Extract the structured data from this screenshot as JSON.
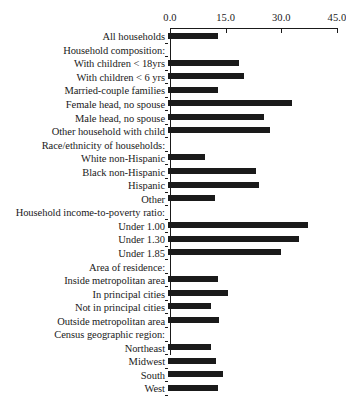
{
  "chart_data": {
    "type": "bar",
    "orientation": "horizontal",
    "title": "",
    "xlabel": "",
    "ylabel": "",
    "xlim": [
      0.0,
      45.0
    ],
    "xticks": [
      "0.0",
      "15.0",
      "30.0",
      "45.0"
    ],
    "xtick_values": [
      0.0,
      15.0,
      30.0,
      45.0
    ],
    "grid": false,
    "legend": false,
    "bar_color": "#1a1a1a",
    "categories": [
      "All households",
      "Household composition:",
      "With children < 18yrs",
      "With children < 6 yrs",
      "Married-couple families",
      "Female head, no spouse",
      "Male head, no spouse",
      "Other household with child",
      "Race/ethnicity of households:",
      "White non-Hispanic",
      "Black non-Hispanic",
      "Hispanic",
      "Other",
      "Household income-to-poverty ratio:",
      "Under 1.00",
      "Under 1.30",
      "Under 1.85",
      "Area of residence:",
      "Inside metropolitan area",
      "In principal cities",
      "Not in principal cities",
      "Outside metropolitan area",
      "Census geographic region:",
      "Northeast",
      "Midwest",
      "South",
      "West"
    ],
    "values": [
      13.5,
      null,
      19.1,
      20.5,
      13.5,
      33.4,
      25.9,
      27.5,
      null,
      10.0,
      23.7,
      24.5,
      12.7,
      null,
      37.7,
      35.3,
      30.5,
      null,
      13.5,
      16.2,
      11.6,
      13.7,
      null,
      11.6,
      12.9,
      14.8,
      13.5
    ],
    "rows": [
      {
        "label": "All households",
        "value": 13.5,
        "is_header": false
      },
      {
        "label": "Household composition:",
        "value": null,
        "is_header": true
      },
      {
        "label": "With children < 18yrs",
        "value": 19.1,
        "is_header": false
      },
      {
        "label": "With children < 6 yrs",
        "value": 20.5,
        "is_header": false
      },
      {
        "label": "Married-couple families",
        "value": 13.5,
        "is_header": false
      },
      {
        "label": "Female head, no spouse",
        "value": 33.4,
        "is_header": false
      },
      {
        "label": "Male head, no spouse",
        "value": 25.9,
        "is_header": false
      },
      {
        "label": "Other household with child",
        "value": 27.5,
        "is_header": false
      },
      {
        "label": "Race/ethnicity of households:",
        "value": null,
        "is_header": true
      },
      {
        "label": "White non-Hispanic",
        "value": 10.0,
        "is_header": false
      },
      {
        "label": "Black non-Hispanic",
        "value": 23.7,
        "is_header": false
      },
      {
        "label": "Hispanic",
        "value": 24.5,
        "is_header": false
      },
      {
        "label": "Other",
        "value": 12.7,
        "is_header": false
      },
      {
        "label": "Household income-to-poverty ratio:",
        "value": null,
        "is_header": true
      },
      {
        "label": "Under 1.00",
        "value": 37.7,
        "is_header": false
      },
      {
        "label": "Under 1.30",
        "value": 35.3,
        "is_header": false
      },
      {
        "label": "Under 1.85",
        "value": 30.5,
        "is_header": false
      },
      {
        "label": "Area of residence:",
        "value": null,
        "is_header": true
      },
      {
        "label": "Inside metropolitan area",
        "value": 13.5,
        "is_header": false
      },
      {
        "label": "In principal cities",
        "value": 16.2,
        "is_header": false
      },
      {
        "label": "Not in principal cities",
        "value": 11.6,
        "is_header": false
      },
      {
        "label": "Outside metropolitan area",
        "value": 13.7,
        "is_header": false
      },
      {
        "label": "Census geographic region:",
        "value": null,
        "is_header": true
      },
      {
        "label": "Northeast",
        "value": 11.6,
        "is_header": false
      },
      {
        "label": "Midwest",
        "value": 12.9,
        "is_header": false
      },
      {
        "label": "South",
        "value": 14.8,
        "is_header": false
      },
      {
        "label": "West",
        "value": 13.5,
        "is_header": false
      }
    ]
  }
}
